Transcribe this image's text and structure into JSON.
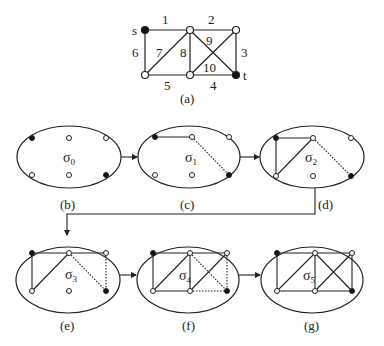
{
  "graph_a": {
    "caption": "(a)",
    "source_label": "s",
    "target_label": "t",
    "edge_labels": [
      "1",
      "2",
      "3",
      "4",
      "5",
      "6",
      "7",
      "8",
      "9",
      "10"
    ]
  },
  "states": [
    {
      "id": "b",
      "caption": "(b)",
      "sigma": "σ",
      "sub": "0"
    },
    {
      "id": "c",
      "caption": "(c)",
      "sigma": "σ",
      "sub": "1"
    },
    {
      "id": "d",
      "caption": "(d)",
      "sigma": "σ",
      "sub": "2"
    },
    {
      "id": "e",
      "caption": "(e)",
      "sigma": "σ",
      "sub": "3"
    },
    {
      "id": "f",
      "caption": "(f)",
      "sigma": "σ",
      "sub": "4"
    },
    {
      "id": "g",
      "caption": "(g)",
      "sigma": "σ",
      "sub": "5"
    }
  ],
  "colors": {
    "line": "#222222",
    "filled_node": "#111111",
    "empty_node": "#ffffff"
  }
}
